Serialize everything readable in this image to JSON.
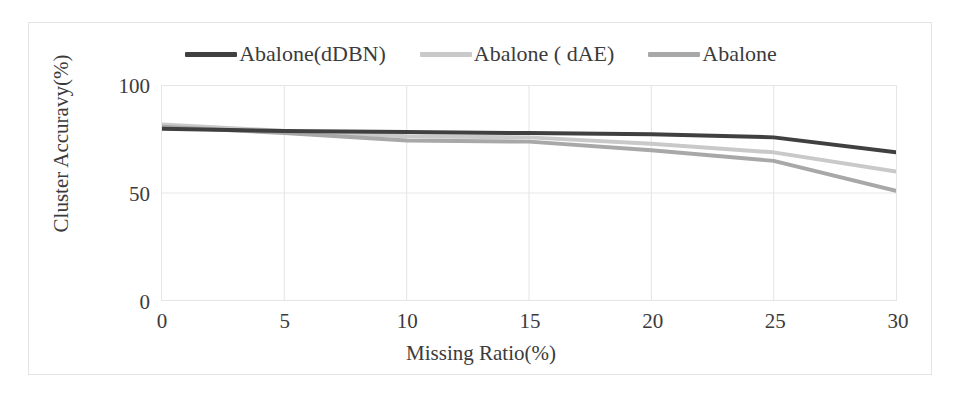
{
  "chart_data": {
    "type": "line",
    "title": "",
    "xlabel": "Missing Ratio(%)",
    "ylabel": "Cluster Accuravy(%)",
    "xlim": [
      0,
      30
    ],
    "ylim": [
      0,
      100
    ],
    "xticks": [
      "0",
      "5",
      "10",
      "15",
      "20",
      "25",
      "30"
    ],
    "xtick_values": [
      0,
      5,
      10,
      15,
      20,
      25,
      30
    ],
    "yticks": [
      "0",
      "50",
      "100"
    ],
    "ytick_values": [
      0,
      50,
      100
    ],
    "grid": true,
    "legend_position": "top-center",
    "x": [
      0,
      5,
      10,
      15,
      20,
      25,
      30
    ],
    "series": [
      {
        "name": "Abalone(dDBN)",
        "color": "#404040",
        "values": [
          80,
          79,
          78.5,
          78,
          77.5,
          76,
          69
        ]
      },
      {
        "name": "Abalone ( dAE)",
        "color": "#c9c9c9",
        "values": [
          82,
          79,
          76.5,
          76,
          73,
          69,
          60
        ]
      },
      {
        "name": "Abalone",
        "color": "#a8a8a8",
        "values": [
          81,
          78,
          74.5,
          74,
          70,
          65,
          51
        ]
      }
    ]
  },
  "legend": {
    "items": [
      {
        "label": "Abalone(dDBN)",
        "color": "#404040"
      },
      {
        "label": "Abalone ( dAE)",
        "color": "#c9c9c9"
      },
      {
        "label": "Abalone",
        "color": "#a8a8a8"
      }
    ]
  },
  "colors": {
    "frame_border": "#e3e3e3",
    "plot_border": "#e6e6e6",
    "gridline": "#e8e8e8",
    "text": "#3b3b3b"
  }
}
